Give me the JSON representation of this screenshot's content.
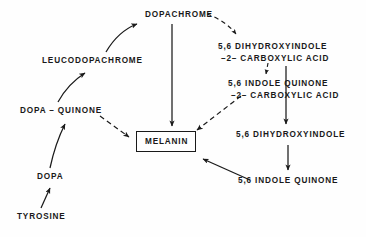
{
  "diagram": {
    "type": "flow-diagram",
    "background_color": "#fefefe",
    "line_color": "#1a1a1a",
    "text_color": "#1a1a1a",
    "nodes": [
      {
        "id": "tyrosine",
        "label": "TYROSINE",
        "x": 17,
        "y": 211,
        "boxed": false
      },
      {
        "id": "dopa",
        "label": "DOPA",
        "x": 37,
        "y": 171,
        "boxed": false
      },
      {
        "id": "dopa_quinone",
        "label": "DOPA – QUINONE",
        "x": 20,
        "y": 105,
        "boxed": false
      },
      {
        "id": "leucodopachrome",
        "label": "LEUCODOPACHROME",
        "x": 42,
        "y": 55,
        "boxed": false
      },
      {
        "id": "dopachrome",
        "label": "DOPACHROME",
        "x": 145,
        "y": 9,
        "boxed": false
      },
      {
        "id": "melanin",
        "label": "MELANIN",
        "x": 136,
        "y": 131,
        "boxed": true
      },
      {
        "id": "dhica",
        "label_line1": "5,6 DIHYDROXYINDOLE",
        "label_line2": "–2– CARBOXYLIC ACID",
        "x": 218,
        "y": 41,
        "boxed": false
      },
      {
        "id": "iqca",
        "label_line1": "5,6 INDOLE QUINONE",
        "label_line2": "–2– CARBOXYLIC ACID",
        "x": 228,
        "y": 78,
        "boxed": false
      },
      {
        "id": "dhi",
        "label": "5,6 DIHYDROXYINDOLE",
        "x": 236,
        "y": 129,
        "boxed": false
      },
      {
        "id": "indole_quinone",
        "label": "5,6 INDOLE QUINONE",
        "x": 238,
        "y": 175,
        "boxed": false
      }
    ],
    "edges": [
      {
        "id": "tyrosine-to-dopa",
        "from": "tyrosine",
        "to": "dopa",
        "style": "solid",
        "shape": "straight"
      },
      {
        "id": "dopa-to-dopa-quinone",
        "from": "dopa",
        "to": "dopa_quinone",
        "style": "solid",
        "shape": "curved"
      },
      {
        "id": "dopa-quinone-to-leucodopachrome",
        "from": "dopa_quinone",
        "to": "leucodopachrome",
        "style": "solid",
        "shape": "curved"
      },
      {
        "id": "leucodopachrome-to-dopachrome",
        "from": "leucodopachrome",
        "to": "dopachrome",
        "style": "solid",
        "shape": "curved"
      },
      {
        "id": "dopachrome-to-melanin",
        "from": "dopachrome",
        "to": "melanin",
        "style": "solid",
        "shape": "vertical"
      },
      {
        "id": "dopa-quinone-to-melanin",
        "from": "dopa_quinone",
        "to": "melanin",
        "style": "dashed",
        "shape": "straight"
      },
      {
        "id": "dopachrome-to-dhica",
        "from": "dopachrome",
        "to": "dhica",
        "style": "dashed",
        "shape": "curved"
      },
      {
        "id": "dhica-to-iqca",
        "from": "dhica",
        "to": "iqca",
        "style": "dashed",
        "shape": "straight"
      },
      {
        "id": "iqca-to-melanin",
        "from": "iqca",
        "to": "melanin",
        "style": "dashed",
        "shape": "straight"
      },
      {
        "id": "dhica-to-dhi",
        "from": "dhica",
        "to": "dhi",
        "style": "solid",
        "shape": "vertical"
      },
      {
        "id": "dhi-to-indole-quinone",
        "from": "dhi",
        "to": "indole_quinone",
        "style": "solid",
        "shape": "vertical"
      },
      {
        "id": "indole-quinone-to-melanin",
        "from": "indole_quinone",
        "to": "melanin",
        "style": "solid",
        "shape": "straight"
      }
    ]
  }
}
